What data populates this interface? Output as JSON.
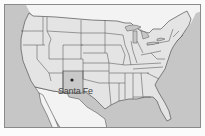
{
  "map": {
    "title": "United States",
    "colors": {
      "ocean": "#c6c6c6",
      "land_us": "#e4e4e4",
      "land_foreign": "#f3f3f3",
      "highlight_state": "#c9c9c9",
      "border": "#555555"
    },
    "highlighted_state": "New Mexico",
    "marker": {
      "label": "Santa Fe",
      "type": "capital-dot"
    }
  }
}
